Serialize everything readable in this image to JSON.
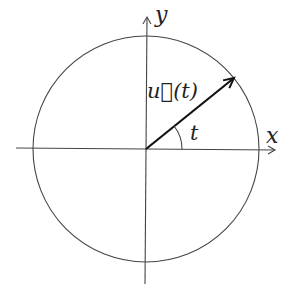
{
  "diagram": {
    "type": "unit-circle",
    "labels": {
      "x_axis": "x",
      "y_axis": "y",
      "vector": "u⃗(t)",
      "angle": "t"
    },
    "colors": {
      "stroke": "#444444",
      "vector": "#111111",
      "background": "#ffffff"
    }
  }
}
